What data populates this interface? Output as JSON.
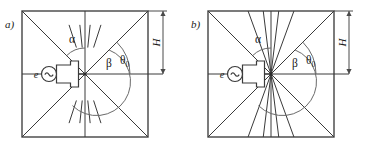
{
  "figure": {
    "background_color": "#ffffff",
    "line_color": "#3a3a3a",
    "frame_color": "#444444",
    "arc_color": "#6a6a6a",
    "width": 372,
    "height": 154
  },
  "panels": [
    {
      "id": "panel-a",
      "label": "a)",
      "square": {
        "x": 22,
        "y": 11,
        "size": 126
      },
      "center": {
        "x": 85,
        "y": 74
      },
      "source_label": "e",
      "source_symbol": "~",
      "angles": {
        "alpha": {
          "label": "α",
          "x": 69,
          "y": 43
        },
        "beta": {
          "label": "β",
          "x": 106,
          "y": 67
        },
        "theta": {
          "label": "θ",
          "sub": "0",
          "x": 120,
          "y": 64
        }
      },
      "dimension": {
        "label": "H",
        "x": 163,
        "y_top": 11,
        "y_bottom": 74
      },
      "ray_style": "dashes",
      "ray_angles_deg": [
        252,
        264,
        276,
        288,
        72,
        84,
        96,
        108
      ],
      "dash_inner_frac": 0.42,
      "dash_outer_frac": 0.78
    },
    {
      "id": "panel-b",
      "label": "b)",
      "square": {
        "x": 208,
        "y": 11,
        "size": 126
      },
      "center": {
        "x": 271,
        "y": 74
      },
      "source_label": "e",
      "source_symbol": "~",
      "angles": {
        "alpha": {
          "label": "α",
          "x": 255,
          "y": 43
        },
        "beta": {
          "label": "β",
          "x": 292,
          "y": 67
        },
        "theta": {
          "label": "θ",
          "sub": "0",
          "x": 306,
          "y": 64
        }
      },
      "dimension": {
        "label": "H",
        "x": 349,
        "y_top": 11,
        "y_bottom": 74
      },
      "ray_style": "full",
      "ray_angles_deg": [
        250,
        263,
        277,
        290,
        70,
        83,
        97,
        110
      ],
      "dash_inner_frac": 0.0,
      "dash_outer_frac": 1.0
    }
  ],
  "chart_data": {
    "type": "diagram",
    "panels": [
      "a)",
      "b)"
    ],
    "symbols": [
      "α",
      "β",
      "θ₀",
      "H",
      "e",
      "~"
    ],
    "notes": [
      "Panel a) shows short detached ray dashes between the diagonals.",
      "Panel b) shows full-length rays reaching the square boundary.",
      "Both panels share identical square frame, diagonals, median lines, source symbol and H dimension."
    ]
  }
}
